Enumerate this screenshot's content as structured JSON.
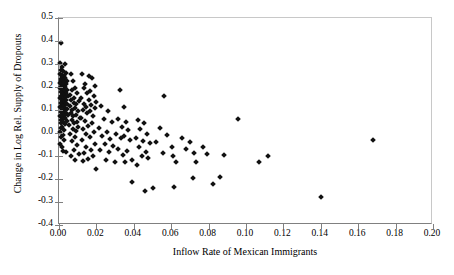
{
  "chart_data": {
    "type": "scatter",
    "title": "",
    "xlabel": "Inflow Rate of Mexican Immigrants",
    "ylabel": "Change in Log Rel. Supply of Dropouts",
    "xlim": [
      0.0,
      0.2
    ],
    "ylim": [
      -0.4,
      0.5
    ],
    "xticks": [
      "0.00",
      "0.02",
      "0.04",
      "0.06",
      "0.08",
      "0.10",
      "0.12",
      "0.14",
      "0.16",
      "0.18",
      "0.20"
    ],
    "xtick_values": [
      0.0,
      0.02,
      0.04,
      0.06,
      0.08,
      0.1,
      0.12,
      0.14,
      0.16,
      0.18,
      0.2
    ],
    "yticks": [
      "0.5",
      "0.4",
      "0.3",
      "0.2",
      "0.1",
      "0.0",
      "-0.1",
      "-0.2",
      "-0.3",
      "-0.4"
    ],
    "ytick_values": [
      0.5,
      0.4,
      0.3,
      0.2,
      0.1,
      0.0,
      -0.1,
      -0.2,
      -0.3,
      -0.4
    ],
    "grid": false,
    "legend": null,
    "marker": "diamond",
    "marker_color": "#111111",
    "series": [
      {
        "name": "US metro areas",
        "points": [
          [
            0.0012,
            0.393
          ],
          [
            0.0008,
            0.305
          ],
          [
            0.003,
            0.3
          ],
          [
            0.0016,
            0.288
          ],
          [
            0.001,
            0.272
          ],
          [
            0.0022,
            0.268
          ],
          [
            0.004,
            0.262
          ],
          [
            0.0006,
            0.258
          ],
          [
            0.0014,
            0.252
          ],
          [
            0.0026,
            0.248
          ],
          [
            0.0018,
            0.243
          ],
          [
            0.0034,
            0.238
          ],
          [
            0.0009,
            0.235
          ],
          [
            0.0021,
            0.231
          ],
          [
            0.0044,
            0.228
          ],
          [
            0.0013,
            0.224
          ],
          [
            0.0028,
            0.22
          ],
          [
            0.0007,
            0.217
          ],
          [
            0.0038,
            0.213
          ],
          [
            0.0017,
            0.209
          ],
          [
            0.0024,
            0.205
          ],
          [
            0.0011,
            0.202
          ],
          [
            0.0032,
            0.199
          ],
          [
            0.0005,
            0.196
          ],
          [
            0.002,
            0.192
          ],
          [
            0.0042,
            0.189
          ],
          [
            0.0015,
            0.185
          ],
          [
            0.0029,
            0.181
          ],
          [
            0.0009,
            0.178
          ],
          [
            0.0036,
            0.174
          ],
          [
            0.0019,
            0.17
          ],
          [
            0.0025,
            0.166
          ],
          [
            0.0012,
            0.162
          ],
          [
            0.0048,
            0.159
          ],
          [
            0.0031,
            0.155
          ],
          [
            0.0007,
            0.151
          ],
          [
            0.0022,
            0.147
          ],
          [
            0.0039,
            0.143
          ],
          [
            0.0016,
            0.139
          ],
          [
            0.0027,
            0.135
          ],
          [
            0.001,
            0.131
          ],
          [
            0.0034,
            0.128
          ],
          [
            0.0045,
            0.124
          ],
          [
            0.0018,
            0.12
          ],
          [
            0.0023,
            0.116
          ],
          [
            0.0008,
            0.112
          ],
          [
            0.003,
            0.108
          ],
          [
            0.0041,
            0.104
          ],
          [
            0.0014,
            0.1
          ],
          [
            0.0026,
            0.096
          ],
          [
            0.0011,
            0.092
          ],
          [
            0.0036,
            0.088
          ],
          [
            0.0019,
            0.084
          ],
          [
            0.0047,
            0.08
          ],
          [
            0.0006,
            0.076
          ],
          [
            0.0028,
            0.072
          ],
          [
            0.0015,
            0.068
          ],
          [
            0.0033,
            0.064
          ],
          [
            0.0021,
            0.06
          ],
          [
            0.0009,
            0.056
          ],
          [
            0.0043,
            0.052
          ],
          [
            0.0024,
            0.048
          ],
          [
            0.0013,
            0.044
          ],
          [
            0.0031,
            0.04
          ],
          [
            0.0017,
            0.028
          ],
          [
            0.001,
            0.02
          ],
          [
            0.0025,
            0.012
          ],
          [
            0.0008,
            0.004
          ],
          [
            0.0019,
            -0.008
          ],
          [
            0.0012,
            -0.018
          ],
          [
            0.0028,
            -0.03
          ],
          [
            0.0006,
            -0.048
          ],
          [
            0.0016,
            -0.062
          ],
          [
            0.0022,
            -0.078
          ],
          [
            0.0035,
            -0.084
          ],
          [
            0.0062,
            0.258
          ],
          [
            0.0075,
            0.226
          ],
          [
            0.0088,
            0.196
          ],
          [
            0.007,
            0.186
          ],
          [
            0.0095,
            0.172
          ],
          [
            0.0058,
            0.166
          ],
          [
            0.0082,
            0.152
          ],
          [
            0.0066,
            0.144
          ],
          [
            0.0105,
            0.138
          ],
          [
            0.0078,
            0.13
          ],
          [
            0.0092,
            0.124
          ],
          [
            0.006,
            0.118
          ],
          [
            0.0086,
            0.11
          ],
          [
            0.0072,
            0.102
          ],
          [
            0.01,
            0.096
          ],
          [
            0.0064,
            0.088
          ],
          [
            0.009,
            0.08
          ],
          [
            0.0076,
            0.072
          ],
          [
            0.011,
            0.066
          ],
          [
            0.0068,
            0.058
          ],
          [
            0.0098,
            0.05
          ],
          [
            0.008,
            0.042
          ],
          [
            0.0056,
            0.034
          ],
          [
            0.0104,
            0.026
          ],
          [
            0.0073,
            0.018
          ],
          [
            0.0091,
            0.008
          ],
          [
            0.0061,
            -0.004
          ],
          [
            0.0084,
            -0.016
          ],
          [
            0.0069,
            -0.034
          ],
          [
            0.0096,
            -0.052
          ],
          [
            0.0079,
            -0.076
          ],
          [
            0.0108,
            -0.09
          ],
          [
            0.0063,
            -0.1
          ],
          [
            0.0088,
            -0.118
          ],
          [
            0.0125,
            0.256
          ],
          [
            0.016,
            0.25
          ],
          [
            0.0178,
            0.238
          ],
          [
            0.014,
            0.212
          ],
          [
            0.0195,
            0.206
          ],
          [
            0.0132,
            0.196
          ],
          [
            0.0168,
            0.184
          ],
          [
            0.0148,
            0.176
          ],
          [
            0.0185,
            0.16
          ],
          [
            0.012,
            0.152
          ],
          [
            0.0158,
            0.144
          ],
          [
            0.02,
            0.136
          ],
          [
            0.0136,
            0.128
          ],
          [
            0.0172,
            0.122
          ],
          [
            0.0144,
            0.114
          ],
          [
            0.019,
            0.108
          ],
          [
            0.0128,
            0.1
          ],
          [
            0.0164,
            0.094
          ],
          [
            0.0152,
            0.086
          ],
          [
            0.018,
            0.076
          ],
          [
            0.0118,
            0.066
          ],
          [
            0.0138,
            0.052
          ],
          [
            0.0175,
            0.044
          ],
          [
            0.0156,
            0.03
          ],
          [
            0.013,
            0.016
          ],
          [
            0.0188,
            0.006
          ],
          [
            0.0146,
            -0.006
          ],
          [
            0.0166,
            -0.018
          ],
          [
            0.0122,
            -0.032
          ],
          [
            0.0192,
            -0.046
          ],
          [
            0.0142,
            -0.062
          ],
          [
            0.017,
            -0.074
          ],
          [
            0.0134,
            -0.086
          ],
          [
            0.0182,
            -0.098
          ],
          [
            0.0154,
            -0.112
          ],
          [
            0.0126,
            -0.122
          ],
          [
            0.02,
            -0.155
          ],
          [
            0.0225,
            0.116
          ],
          [
            0.026,
            0.096
          ],
          [
            0.024,
            0.06
          ],
          [
            0.0285,
            0.048
          ],
          [
            0.0215,
            0.022
          ],
          [
            0.0255,
            0.004
          ],
          [
            0.023,
            -0.012
          ],
          [
            0.0275,
            -0.028
          ],
          [
            0.0245,
            -0.046
          ],
          [
            0.029,
            -0.058
          ],
          [
            0.022,
            -0.072
          ],
          [
            0.0265,
            -0.082
          ],
          [
            0.025,
            -0.118
          ],
          [
            0.03,
            -0.124
          ],
          [
            0.0325,
            0.186
          ],
          [
            0.0345,
            0.112
          ],
          [
            0.0315,
            0.06
          ],
          [
            0.036,
            0.05
          ],
          [
            0.0335,
            0.024
          ],
          [
            0.037,
            0.012
          ],
          [
            0.0305,
            -0.004
          ],
          [
            0.035,
            -0.012
          ],
          [
            0.033,
            -0.02
          ],
          [
            0.038,
            -0.03
          ],
          [
            0.0318,
            -0.068
          ],
          [
            0.0365,
            -0.078
          ],
          [
            0.034,
            -0.094
          ],
          [
            0.0388,
            -0.118
          ],
          [
            0.0355,
            -0.128
          ],
          [
            0.039,
            -0.212
          ],
          [
            0.042,
            0.056
          ],
          [
            0.0455,
            0.042
          ],
          [
            0.0435,
            0.018
          ],
          [
            0.047,
            -0.006
          ],
          [
            0.041,
            -0.022
          ],
          [
            0.045,
            -0.036
          ],
          [
            0.0488,
            -0.042
          ],
          [
            0.0428,
            -0.062
          ],
          [
            0.0465,
            -0.082
          ],
          [
            0.0442,
            -0.102
          ],
          [
            0.0478,
            -0.11
          ],
          [
            0.0415,
            -0.14
          ],
          [
            0.046,
            -0.25
          ],
          [
            0.05,
            -0.238
          ],
          [
            0.056,
            0.16
          ],
          [
            0.054,
            0.02
          ],
          [
            0.058,
            -0.008
          ],
          [
            0.052,
            -0.038
          ],
          [
            0.0605,
            -0.06
          ],
          [
            0.0555,
            -0.086
          ],
          [
            0.061,
            -0.098
          ],
          [
            0.0625,
            -0.126
          ],
          [
            0.0615,
            -0.236
          ],
          [
            0.066,
            -0.02
          ],
          [
            0.068,
            -0.068
          ],
          [
            0.07,
            -0.04
          ],
          [
            0.072,
            -0.086
          ],
          [
            0.0735,
            -0.128
          ],
          [
            0.0715,
            -0.196
          ],
          [
            0.077,
            -0.06
          ],
          [
            0.079,
            -0.092
          ],
          [
            0.0825,
            -0.222
          ],
          [
            0.086,
            -0.19
          ],
          [
            0.088,
            -0.096
          ],
          [
            0.0955,
            0.06
          ],
          [
            0.107,
            -0.124
          ],
          [
            0.112,
            -0.098
          ],
          [
            0.14,
            -0.278
          ],
          [
            0.168,
            -0.032
          ]
        ]
      }
    ]
  }
}
